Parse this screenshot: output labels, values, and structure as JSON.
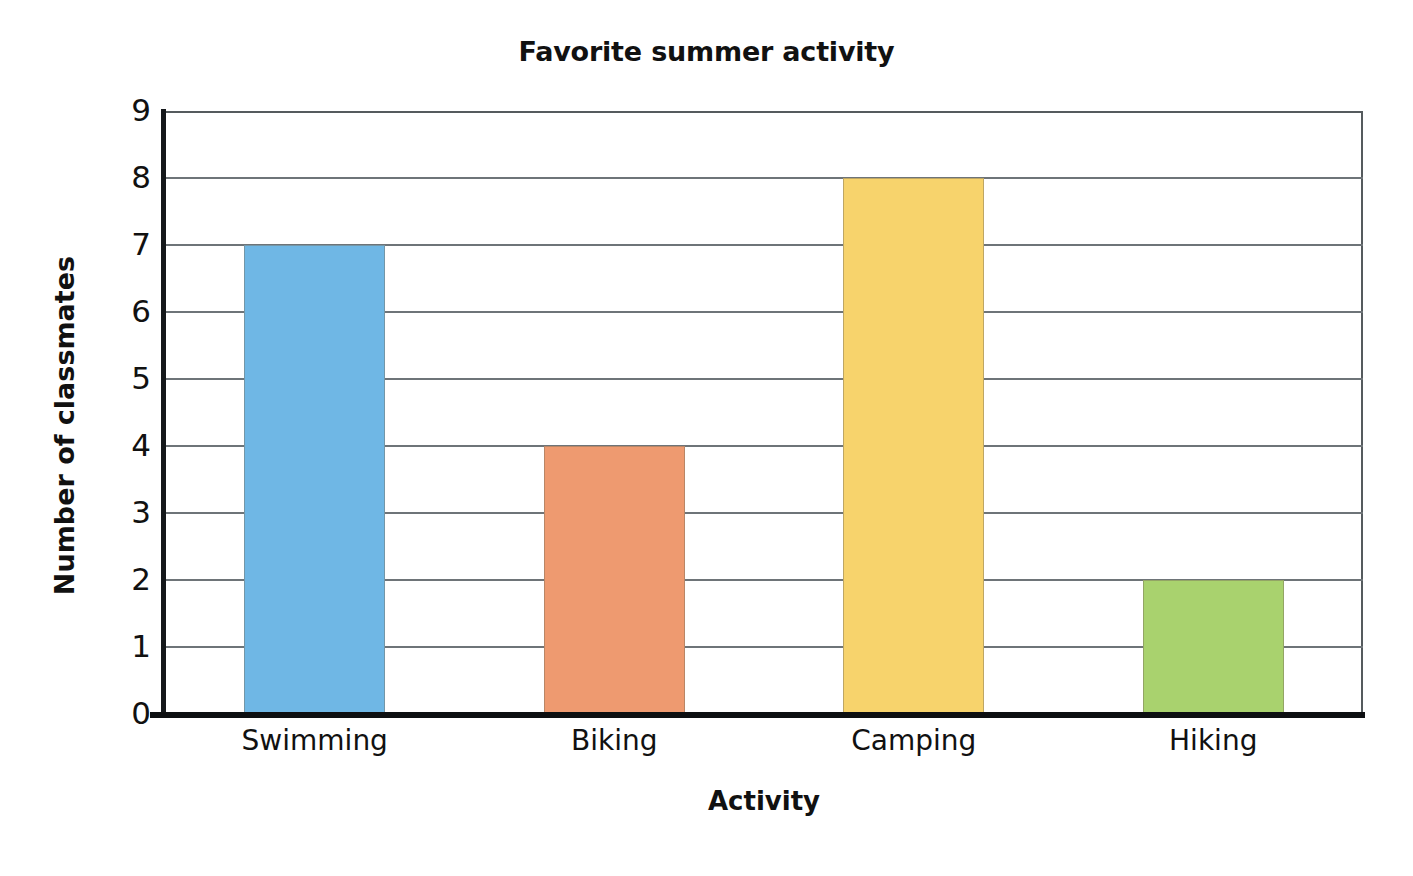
{
  "chart_data": {
    "type": "bar",
    "title": "Favorite summer activity",
    "xlabel": "Activity",
    "ylabel": "Number of classmates",
    "categories": [
      "Swimming",
      "Biking",
      "Camping",
      "Hiking"
    ],
    "values": [
      7,
      4,
      8,
      2
    ],
    "bar_colors": [
      "#6FB7E5",
      "#EE9A70",
      "#F7D36C",
      "#A9D26E"
    ],
    "ylim": [
      0,
      9
    ],
    "ytick_labels": [
      "9",
      "8",
      "7",
      "6",
      "5",
      "4",
      "3",
      "2",
      "1",
      "0"
    ],
    "ytick_values": [
      9,
      8,
      7,
      6,
      5,
      4,
      3,
      2,
      1,
      0
    ],
    "grid": true,
    "legend": "none",
    "series": [
      {
        "name": "Number of classmates",
        "points": [
          {
            "category": "Swimming",
            "value": 7,
            "color": "#6FB7E5"
          },
          {
            "category": "Biking",
            "value": 4,
            "color": "#EE9A70"
          },
          {
            "category": "Camping",
            "value": 8,
            "color": "#F7D36C"
          },
          {
            "category": "Hiking",
            "value": 2,
            "color": "#A9D26E"
          }
        ]
      }
    ]
  }
}
